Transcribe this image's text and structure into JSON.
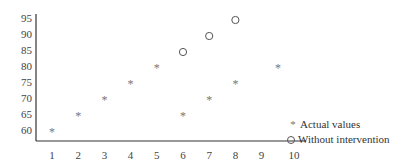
{
  "chart_data": {
    "type": "scatter",
    "title": "",
    "xlabel": "",
    "ylabel": "",
    "x_ticks": [
      "1",
      "2",
      "3",
      "4",
      "5",
      "6",
      "7",
      "8",
      "9",
      "10"
    ],
    "y_ticks": [
      "60",
      "65",
      "70",
      "75",
      "80",
      "85",
      "90",
      "95"
    ],
    "xlim": [
      0.4,
      10.6
    ],
    "ylim": [
      56,
      96
    ],
    "grid": false,
    "legend_position": "lower right",
    "series": [
      {
        "name": "Actual values",
        "marker": "asterisk",
        "points": [
          [
            1,
            60
          ],
          [
            2,
            65
          ],
          [
            3,
            70
          ],
          [
            4,
            75
          ],
          [
            5,
            80
          ],
          [
            6,
            65
          ],
          [
            7,
            70
          ],
          [
            8,
            75
          ],
          [
            10,
            80
          ]
        ]
      },
      {
        "name": "Without intervention",
        "marker": "open-circle",
        "points": [
          [
            6,
            85
          ],
          [
            7,
            90
          ],
          [
            8,
            95
          ]
        ]
      }
    ]
  },
  "legend": {
    "items": [
      {
        "symbol": "*",
        "label": "Actual values"
      },
      {
        "symbol": "○",
        "label": "Without intervention"
      }
    ]
  }
}
